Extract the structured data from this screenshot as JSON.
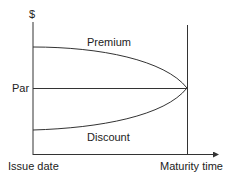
{
  "diagram": {
    "y_axis_label": "$",
    "par_label": "Par",
    "premium_label": "Premium",
    "discount_label": "Discount",
    "x_start_label": "Issue date",
    "x_end_label": "Maturity time",
    "line_color": "#333333"
  }
}
